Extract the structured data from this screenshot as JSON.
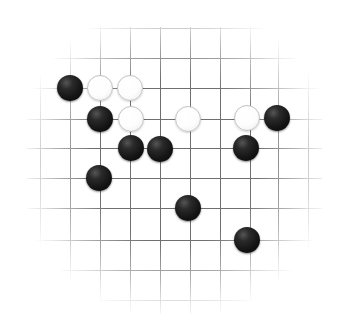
{
  "board": {
    "title": "Go board position",
    "kind": "go-board",
    "background_color": "#ffffff",
    "line_color": "#6f6f6f",
    "black_color": "#141414",
    "white_color": "#ffffff",
    "columns": 8,
    "rows": 8,
    "grid_spacing_px": 30,
    "origin_x_px": 70,
    "origin_y_px": 58,
    "stone_diameter_px": 26,
    "column_x_px": [
      70,
      100,
      130,
      160,
      190,
      220,
      250,
      278
    ],
    "row_y_px": [
      58,
      88,
      119,
      148,
      178,
      208,
      240,
      270
    ],
    "edge_fade": "radial vignette, lines fade out toward the border"
  },
  "stones": [
    {
      "color": "black",
      "col": 0,
      "row": 1,
      "x": 70,
      "y": 88,
      "label": "black-stone-a"
    },
    {
      "color": "white",
      "col": 1,
      "row": 1,
      "x": 100,
      "y": 88,
      "label": "white-stone-a"
    },
    {
      "color": "white",
      "col": 2,
      "row": 1,
      "x": 130,
      "y": 88,
      "label": "white-stone-b"
    },
    {
      "color": "black",
      "col": 1,
      "row": 2,
      "x": 100,
      "y": 119,
      "label": "black-stone-b"
    },
    {
      "color": "white",
      "col": 2,
      "row": 2,
      "x": 131,
      "y": 119,
      "label": "white-stone-c"
    },
    {
      "color": "white",
      "col": 4,
      "row": 2,
      "x": 188,
      "y": 119,
      "label": "white-stone-d"
    },
    {
      "color": "white",
      "col": 6,
      "row": 2,
      "x": 247,
      "y": 118,
      "label": "white-stone-e"
    },
    {
      "color": "black",
      "col": 7,
      "row": 2,
      "x": 277,
      "y": 118,
      "label": "black-stone-c"
    },
    {
      "color": "black",
      "col": 2,
      "row": 3,
      "x": 131,
      "y": 148,
      "label": "black-stone-d"
    },
    {
      "color": "black",
      "col": 3,
      "row": 3,
      "x": 160,
      "y": 149,
      "label": "black-stone-e"
    },
    {
      "color": "black",
      "col": 6,
      "row": 3,
      "x": 246,
      "y": 148,
      "label": "black-stone-f"
    },
    {
      "color": "black",
      "col": 1,
      "row": 4,
      "x": 99,
      "y": 178,
      "label": "black-stone-g"
    },
    {
      "color": "black",
      "col": 4,
      "row": 5,
      "x": 188,
      "y": 208,
      "label": "black-stone-h"
    },
    {
      "color": "black",
      "col": 6,
      "row": 6,
      "x": 247,
      "y": 240,
      "label": "black-stone-i"
    }
  ],
  "counts": {
    "black_total": 9,
    "white_total": 5,
    "stones_total": 14
  }
}
